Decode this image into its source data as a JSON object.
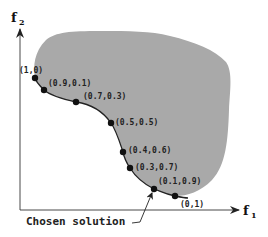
{
  "diagram": {
    "axes": {
      "x_label": "f",
      "x_subscript": "1",
      "y_label": "f",
      "y_subscript": "2"
    },
    "feasible_region_color": "#a9a9a9",
    "front_points": [
      {
        "label": "(1,0)",
        "x": 35,
        "y": 78
      },
      {
        "label": "(0.9,0.1)",
        "x": 44,
        "y": 90
      },
      {
        "label": "(0.7,0.3)",
        "x": 76,
        "y": 102
      },
      {
        "label": "(0.5,0.5)",
        "x": 111,
        "y": 123
      },
      {
        "label": "(0.4,0.6)",
        "x": 123,
        "y": 152
      },
      {
        "label": "(0.3,0.7)",
        "x": 130,
        "y": 168
      },
      {
        "label": "(0.1,0.9)",
        "x": 154,
        "y": 189
      },
      {
        "label": "(0,1)",
        "x": 175,
        "y": 196
      }
    ],
    "annotation": {
      "text": "Chosen solution",
      "points_to": "(0.1,0.9)"
    }
  }
}
